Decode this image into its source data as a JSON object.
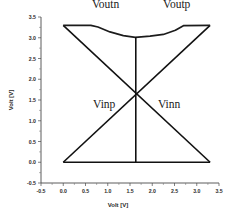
{
  "chart_data": {
    "type": "line",
    "title": "",
    "xlabel": "Volt [V]",
    "ylabel": "Volt [V]",
    "xlim": [
      -0.5,
      3.5
    ],
    "ylim": [
      -0.5,
      3.5
    ],
    "xticks": [
      "-0.5",
      "0.0",
      "0.5",
      "1.0",
      "1.5",
      "2.0",
      "2.5",
      "3.0",
      "3.5"
    ],
    "xtick_values": [
      -0.5,
      0.0,
      0.5,
      1.0,
      1.5,
      2.0,
      2.5,
      3.0,
      3.5
    ],
    "yticks": [
      "-0.5",
      "0.0",
      "0.5",
      "1.0",
      "1.5",
      "2.0",
      "2.5",
      "3.0",
      "3.5"
    ],
    "ytick_values": [
      -0.5,
      0.0,
      0.5,
      1.0,
      1.5,
      2.0,
      2.5,
      3.0,
      3.5
    ],
    "grid": false,
    "legend": "none",
    "annotations": [
      {
        "text": "Voutn",
        "x": 0.95,
        "y": 3.72
      },
      {
        "text": "Voutp",
        "x": 2.55,
        "y": 3.72
      },
      {
        "text": "Vinp",
        "x": 0.92,
        "y": 1.3
      },
      {
        "text": "Vinn",
        "x": 2.38,
        "y": 1.3
      }
    ],
    "series": [
      {
        "name": "Vinp",
        "color": "#111111",
        "x": [
          0.0,
          3.3
        ],
        "y": [
          0.0,
          3.3
        ]
      },
      {
        "name": "Vinn",
        "color": "#111111",
        "x": [
          0.0,
          3.3
        ],
        "y": [
          3.3,
          0.0
        ]
      },
      {
        "name": "Voutn",
        "color": "#1c1c1c",
        "x": [
          0.0,
          0.62,
          0.78,
          1.05,
          1.35,
          1.62
        ],
        "y": [
          3.3,
          3.3,
          3.26,
          3.14,
          3.05,
          3.01
        ]
      },
      {
        "name": "Voutp",
        "color": "#1c1c1c",
        "x": [
          1.62,
          1.95,
          2.25,
          2.52,
          2.7,
          3.3
        ],
        "y": [
          3.01,
          3.04,
          3.08,
          3.18,
          3.29,
          3.3
        ]
      },
      {
        "name": "crossover-marker",
        "color": "#111111",
        "x": [
          1.63,
          1.63
        ],
        "y": [
          0.0,
          3.02
        ]
      },
      {
        "name": "baseline",
        "color": "#111111",
        "x": [
          0.0,
          3.3
        ],
        "y": [
          0.0,
          0.0
        ]
      }
    ],
    "crossover_point": {
      "x": 1.65,
      "y": 1.65
    }
  }
}
